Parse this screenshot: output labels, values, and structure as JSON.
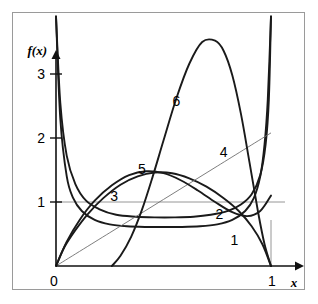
{
  "figure": {
    "background_color": "#ffffff",
    "frame_color": "#9a9a9a",
    "curve_color": "#1a1a1a",
    "thin_line_color": "#6f6f6f",
    "gridline_color": "#8b8b8b"
  },
  "axes": {
    "y_axis_label": "f(x)",
    "x_axis_label": "x",
    "y_ticks": [
      {
        "label": "1",
        "value": 1
      },
      {
        "label": "2",
        "value": 2
      },
      {
        "label": "3",
        "value": 3
      }
    ],
    "x_ticks": [
      {
        "label": "0",
        "value": 0
      },
      {
        "label": "1",
        "value": 1
      }
    ],
    "xlim": [
      0,
      1
    ],
    "ylim": [
      0,
      3.9
    ]
  },
  "curve_labels": [
    {
      "id": "1",
      "text": "1"
    },
    {
      "id": "2",
      "text": "2"
    },
    {
      "id": "3",
      "text": "3"
    },
    {
      "id": "4",
      "text": "4"
    },
    {
      "id": "5",
      "text": "5"
    },
    {
      "id": "6",
      "text": "6"
    }
  ],
  "chart_data": {
    "type": "line",
    "title": "",
    "xlabel": "x",
    "ylabel": "f(x)",
    "xlim": [
      0,
      1
    ],
    "ylim": [
      0,
      3.9
    ],
    "grid": false,
    "legend_position": "inline-labels",
    "xticks": [
      0,
      1
    ],
    "xticklabels": [
      "0",
      "1"
    ],
    "yticks": [
      1,
      2,
      3
    ],
    "yticklabels": [
      "1",
      "2",
      "3"
    ],
    "annotations": [
      {
        "text": "1",
        "x": 0.83,
        "y": 0.4
      },
      {
        "text": "2",
        "x": 0.76,
        "y": 0.82
      },
      {
        "text": "3",
        "x": 0.27,
        "y": 1.1
      },
      {
        "text": "4",
        "x": 0.78,
        "y": 1.78
      },
      {
        "text": "5",
        "x": 0.4,
        "y": 1.52
      },
      {
        "text": "6",
        "x": 0.56,
        "y": 2.58
      }
    ],
    "reference_lines": [
      {
        "orientation": "horizontal",
        "value": 1,
        "color": "#8b8b8b",
        "width": 0.9
      },
      {
        "orientation": "vertical",
        "value": 1,
        "color": "#8b8b8b",
        "width": 0.9
      }
    ],
    "series": [
      {
        "name": "1",
        "label": "1",
        "style": "thick",
        "x": [
          0.0,
          0.02,
          0.05,
          0.08,
          0.12,
          0.18,
          0.25,
          0.33,
          0.42,
          0.5,
          0.58,
          0.67,
          0.75,
          0.82,
          0.88,
          0.92,
          0.95,
          0.97,
          0.985,
          1.0
        ],
        "y": [
          3.9,
          2.3,
          1.4,
          1.06,
          0.86,
          0.72,
          0.65,
          0.62,
          0.61,
          0.61,
          0.61,
          0.62,
          0.65,
          0.72,
          0.86,
          1.06,
          1.4,
          1.9,
          2.6,
          3.9
        ]
      },
      {
        "name": "2",
        "label": "2",
        "style": "thick",
        "x": [
          0.0,
          0.02,
          0.05,
          0.09,
          0.14,
          0.2,
          0.28,
          0.37,
          0.46,
          0.55,
          0.64,
          0.72,
          0.8,
          0.86,
          0.91,
          0.95,
          0.975,
          0.99,
          1.0
        ],
        "y": [
          3.9,
          2.55,
          1.72,
          1.28,
          1.02,
          0.89,
          0.8,
          0.77,
          0.76,
          0.76,
          0.77,
          0.8,
          0.86,
          0.96,
          1.12,
          1.42,
          1.9,
          2.6,
          3.9
        ]
      },
      {
        "name": "3",
        "label": "3",
        "style": "thick",
        "x": [
          0.0,
          0.04,
          0.09,
          0.15,
          0.22,
          0.3,
          0.38,
          0.46,
          0.54,
          0.62,
          0.7,
          0.78,
          0.85,
          0.91,
          0.96,
          1.0
        ],
        "y": [
          0.0,
          0.3,
          0.56,
          0.82,
          1.06,
          1.27,
          1.4,
          1.46,
          1.45,
          1.37,
          1.24,
          1.06,
          0.86,
          0.62,
          0.34,
          0.0
        ]
      },
      {
        "name": "4",
        "label": "4",
        "style": "thin",
        "x": [
          0.0,
          0.25,
          0.5,
          0.75,
          1.0
        ],
        "y": [
          0.0,
          0.52,
          1.04,
          1.56,
          2.08
        ]
      },
      {
        "name": "5",
        "label": "5",
        "style": "thick",
        "x": [
          0.0,
          0.05,
          0.11,
          0.18,
          0.26,
          0.34,
          0.42,
          0.5,
          0.58,
          0.66,
          0.74,
          0.82,
          0.89,
          0.95,
          1.0
        ],
        "y": [
          0.0,
          0.38,
          0.72,
          1.02,
          1.26,
          1.42,
          1.48,
          1.45,
          1.34,
          1.18,
          1.0,
          0.84,
          0.78,
          0.86,
          1.1
        ]
      },
      {
        "name": "6",
        "label": "6",
        "style": "thick",
        "x": [
          0.26,
          0.3,
          0.35,
          0.4,
          0.45,
          0.5,
          0.56,
          0.62,
          0.68,
          0.74,
          0.78,
          0.82,
          0.86,
          0.9,
          0.94,
          0.97,
          1.0
        ],
        "y": [
          0.0,
          0.16,
          0.46,
          0.88,
          1.4,
          1.96,
          2.62,
          3.16,
          3.5,
          3.52,
          3.36,
          2.98,
          2.38,
          1.62,
          0.84,
          0.34,
          0.0
        ]
      }
    ]
  }
}
